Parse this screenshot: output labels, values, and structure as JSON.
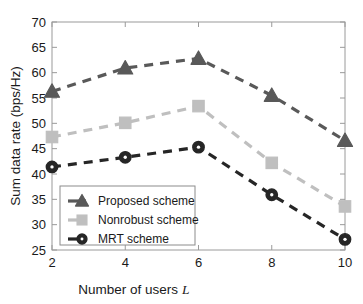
{
  "chart_data": {
    "type": "line",
    "title": "",
    "xlabel": "Number of users L",
    "xlabel_main": "Number of users",
    "xlabel_italic": "L",
    "ylabel": "Sum data rate (bps/Hz)",
    "x": [
      2,
      4,
      6,
      8,
      10
    ],
    "xticklabels": [
      "2",
      "4",
      "6",
      "8",
      "10"
    ],
    "yticks": [
      25,
      30,
      35,
      40,
      45,
      50,
      55,
      60,
      65,
      70
    ],
    "yticklabels": [
      "25",
      "30",
      "35",
      "40",
      "45",
      "50",
      "55",
      "60",
      "65",
      "70"
    ],
    "xlim": [
      2,
      10
    ],
    "ylim": [
      25,
      70
    ],
    "grid": false,
    "legend_position": "lower left",
    "series": [
      {
        "name": "Proposed scheme",
        "marker": "triangle",
        "color": "#595959",
        "linestyle": "dashed",
        "values": [
          56.3,
          60.9,
          62.8,
          55.5,
          46.6
        ]
      },
      {
        "name": "Nonrobust scheme",
        "marker": "square",
        "color": "#bfbfbf",
        "linestyle": "dashed",
        "values": [
          47.3,
          50.1,
          53.4,
          42.2,
          33.6
        ]
      },
      {
        "name": "MRT scheme",
        "marker": "circle",
        "color": "#262626",
        "linestyle": "dashed",
        "values": [
          41.4,
          43.3,
          45.3,
          35.9,
          27.1
        ]
      }
    ]
  },
  "colors": {
    "proposed": "#595959",
    "nonrobust": "#bfbfbf",
    "mrt": "#262626",
    "axis": "#9a9a9a",
    "text": "#1a1a1a",
    "background": "#ffffff"
  }
}
